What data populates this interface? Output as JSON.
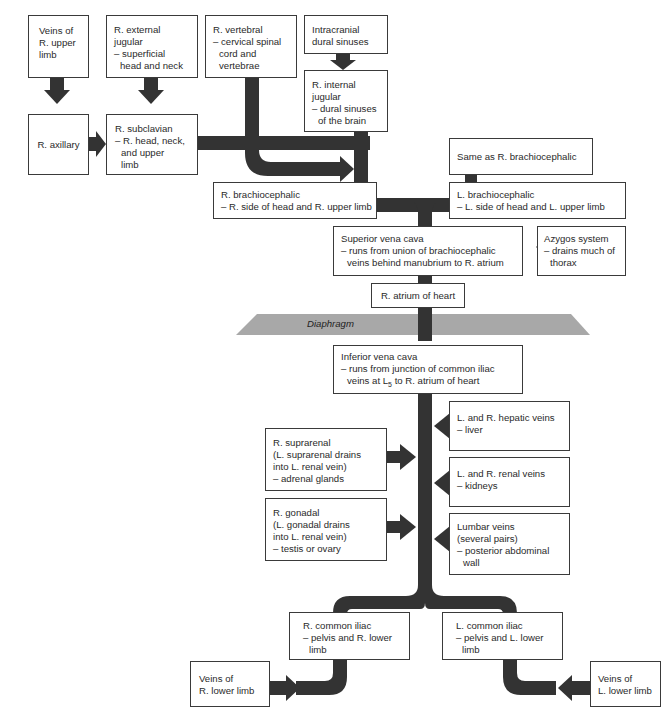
{
  "diagram": {
    "vessel_color": "#333333",
    "diaphragm_color": "#a8a8a8",
    "boxes": {
      "veins_r_upper_limb": {
        "label": [
          "Veins of",
          "R. upper",
          "limb"
        ]
      },
      "r_external_jugular": {
        "title": [
          "R. external",
          "jugular"
        ],
        "desc": [
          "– superficial",
          "head and neck"
        ]
      },
      "r_vertebral": {
        "title": [
          "R. vertebral"
        ],
        "desc": [
          "– cervical spinal",
          "cord and",
          "vertebrae"
        ]
      },
      "intracranial_dural_sinuses": {
        "label": [
          "Intracranial",
          "dural sinuses"
        ]
      },
      "r_internal_jugular": {
        "title": [
          "R. internal",
          "jugular"
        ],
        "desc": [
          "– dural sinuses",
          "of the brain"
        ]
      },
      "r_axillary": {
        "label": "R. axillary"
      },
      "r_subclavian": {
        "title": "R. subclavian",
        "desc": [
          "– R. head, neck,",
          "and upper",
          "limb"
        ]
      },
      "same_as_r_brachiocephalic": {
        "label": "Same as R. brachiocephalic"
      },
      "r_brachiocephalic": {
        "title": "R. brachiocephalic",
        "desc": "– R. side of head and R. upper limb"
      },
      "l_brachiocephalic": {
        "title": "L. brachiocephalic",
        "desc": "– L. side of head and L. upper limb"
      },
      "superior_vena_cava": {
        "title": "Superior vena cava",
        "desc": [
          "– runs from union of brachiocephalic",
          "veins behind manubrium to R. atrium"
        ]
      },
      "azygos_system": {
        "title": "Azygos system",
        "desc": [
          "– drains much of",
          "thorax"
        ]
      },
      "r_atrium": {
        "label": "R. atrium of heart"
      },
      "diaphragm": {
        "label": "Diaphragm"
      },
      "inferior_vena_cava": {
        "title": "Inferior vena cava",
        "desc1": "– runs from junction of common iliac",
        "desc2_pre": "veins at L",
        "desc2_sub": "5",
        "desc2_post": " to R. atrium of heart"
      },
      "hepatic_veins": {
        "title": "L. and R. hepatic veins",
        "desc": "– liver"
      },
      "r_suprarenal": {
        "title": "R. suprarenal",
        "desc": [
          "(L. suprarenal drains",
          "into L. renal vein)",
          "– adrenal glands"
        ]
      },
      "renal_veins": {
        "title": "L. and R. renal veins",
        "desc": "– kidneys"
      },
      "r_gonadal": {
        "title": "R. gonadal",
        "desc": [
          "(L. gonadal drains",
          "into L. renal vein)",
          "– testis or ovary"
        ]
      },
      "lumbar_veins": {
        "title": [
          "Lumbar veins",
          "(several pairs)"
        ],
        "desc": [
          "– posterior abdominal",
          "wall"
        ]
      },
      "r_common_iliac": {
        "title": "R. common iliac",
        "desc": [
          "– pelvis and R. lower",
          "limb"
        ]
      },
      "l_common_iliac": {
        "title": "L. common iliac",
        "desc": [
          "– pelvis and L. lower",
          "limb"
        ]
      },
      "veins_r_lower_limb": {
        "label": [
          "Veins of",
          "R. lower limb"
        ]
      },
      "veins_l_lower_limb": {
        "label": [
          "Veins of",
          "L. lower limb"
        ]
      }
    }
  }
}
